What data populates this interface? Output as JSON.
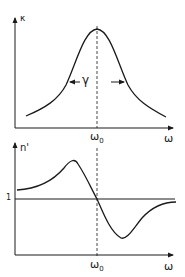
{
  "figure": {
    "top_panel": {
      "y_label": "κ",
      "x_label": "ω",
      "center_label": "ω0",
      "center_label_main": "ω",
      "center_label_sub": "0",
      "width_label": "γ",
      "curve": "Lorentzian absorption peak centered at ω0"
    },
    "bottom_panel": {
      "y_label": "n'",
      "x_label": "ω",
      "center_label_main": "ω",
      "center_label_sub": "0",
      "reference_level_label": "1",
      "curve": "Dispersion curve crossing 1 at ω0"
    },
    "colors": {
      "ink": "#1a1a1a",
      "background": "#ffffff"
    }
  }
}
